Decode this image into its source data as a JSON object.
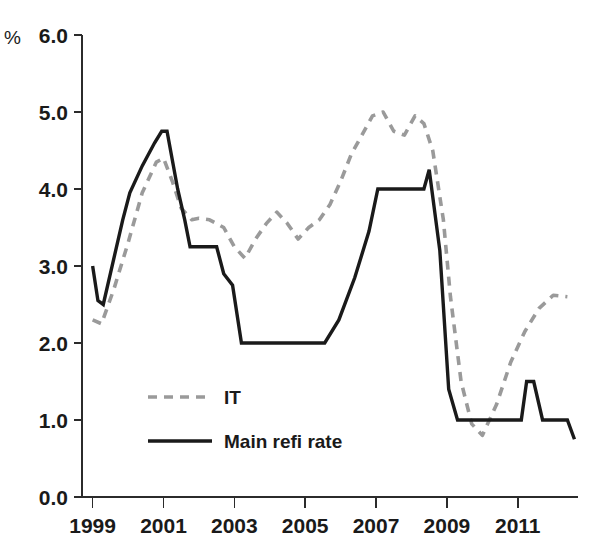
{
  "chart_data": {
    "type": "line",
    "title": "",
    "subtitle": "",
    "xlabel": "",
    "ylabel": "",
    "unit_label": "%",
    "xlim": [
      1998.7,
      2012.7
    ],
    "ylim": [
      0.0,
      6.0
    ],
    "grid": false,
    "legend_position": "inside-lower-left",
    "ytick_labels": [
      "6.0",
      "5.0",
      "4.0",
      "3.0",
      "2.0",
      "1.0",
      "0.0"
    ],
    "ytick_values": [
      6.0,
      5.0,
      4.0,
      3.0,
      2.0,
      1.0,
      0.0
    ],
    "xtick_labels": [
      "1999",
      "2001",
      "2003",
      "2005",
      "2007",
      "2009",
      "2011"
    ],
    "xtick_values": [
      1999,
      2001,
      2003,
      2005,
      2007,
      2009,
      2011
    ],
    "series": [
      {
        "name": "IT",
        "style": "dashed",
        "color": "#9a9a9a",
        "x": [
          1999.0,
          1999.25,
          1999.6,
          2000.0,
          2000.4,
          2000.8,
          2001.0,
          2001.25,
          2001.5,
          2001.8,
          2002.0,
          2002.3,
          2002.7,
          2003.0,
          2003.3,
          2003.6,
          2003.9,
          2004.2,
          2004.5,
          2004.8,
          2005.1,
          2005.4,
          2005.7,
          2006.0,
          2006.3,
          2006.6,
          2006.9,
          2007.2,
          2007.5,
          2007.8,
          2008.1,
          2008.35,
          2008.6,
          2008.9,
          2009.1,
          2009.4,
          2009.7,
          2010.0,
          2010.4,
          2010.8,
          2011.2,
          2011.6,
          2012.0,
          2012.4
        ],
        "y": [
          2.3,
          2.25,
          2.7,
          3.3,
          3.95,
          4.35,
          4.4,
          4.1,
          3.75,
          3.6,
          3.62,
          3.6,
          3.5,
          3.25,
          3.1,
          3.35,
          3.55,
          3.7,
          3.55,
          3.35,
          3.5,
          3.6,
          3.8,
          4.1,
          4.45,
          4.7,
          4.95,
          5.0,
          4.75,
          4.7,
          4.95,
          4.85,
          4.5,
          3.6,
          2.6,
          1.5,
          0.95,
          0.8,
          1.2,
          1.75,
          2.15,
          2.45,
          2.62,
          2.6
        ]
      },
      {
        "name": "Main refi rate",
        "style": "solid",
        "color": "#1a1a1a",
        "x": [
          1999.0,
          1999.15,
          1999.3,
          1999.85,
          2000.05,
          2000.4,
          2000.75,
          2000.95,
          2001.1,
          2001.4,
          2001.6,
          2001.75,
          2002.0,
          2002.5,
          2002.7,
          2002.95,
          2003.2,
          2003.4,
          2005.55,
          2005.95,
          2006.4,
          2006.8,
          2007.05,
          2008.35,
          2008.5,
          2008.8,
          2009.05,
          2009.3,
          2011.1,
          2011.25,
          2011.45,
          2011.7,
          2012.4,
          2012.6
        ],
        "y": [
          3.0,
          2.55,
          2.5,
          3.6,
          3.95,
          4.3,
          4.6,
          4.75,
          4.75,
          4.0,
          3.6,
          3.25,
          3.25,
          3.25,
          2.9,
          2.75,
          2.0,
          2.0,
          2.0,
          2.3,
          2.85,
          3.45,
          4.0,
          4.0,
          4.25,
          3.2,
          1.4,
          1.0,
          1.0,
          1.5,
          1.5,
          1.0,
          1.0,
          0.75
        ]
      }
    ],
    "legend": [
      {
        "label": "IT",
        "style": "dashed",
        "color": "#9a9a9a"
      },
      {
        "label": "Main refi rate",
        "style": "solid",
        "color": "#1a1a1a"
      }
    ]
  },
  "geometry": {
    "plot_left": 82,
    "plot_right": 578,
    "plot_top": 35,
    "plot_bottom": 497
  }
}
